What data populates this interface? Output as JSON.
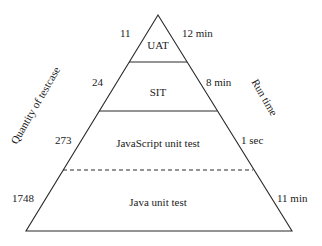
{
  "diagram": {
    "type": "test-pyramid",
    "left_axis_label": "Quantity of testcase",
    "right_axis_label": "Run time",
    "layers": [
      {
        "name": "UAT",
        "quantity": "11",
        "run_time": "12 min"
      },
      {
        "name": "SIT",
        "quantity": "24",
        "run_time": "8 min"
      },
      {
        "name": "JavaScript unit test",
        "quantity": "273",
        "run_time": "1 sec"
      },
      {
        "name": "Java unit test",
        "quantity": "1748",
        "run_time": "11 min"
      }
    ],
    "colors": {
      "line": "#2a2a2a",
      "background": "#ffffff"
    }
  }
}
